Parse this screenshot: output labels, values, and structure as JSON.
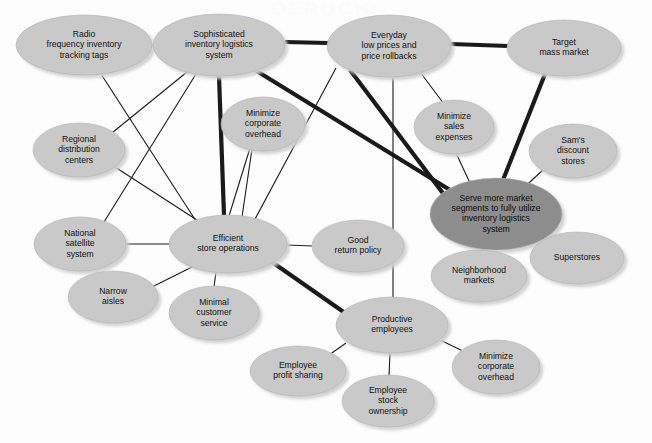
{
  "figure": {
    "kind": "activity-system-map",
    "watermark_text": "DERUCHI",
    "background_color": "#fdfdfd",
    "node_fill_light": "#c9c9c9",
    "node_fill_dark": "#8d8d8d",
    "node_stroke": "#b4b4b4",
    "node_shadow": "#dcdcdc",
    "edge_color": "#1a1a1a",
    "edge_thin_width": 1.1,
    "edge_thick_width": 4.2
  },
  "nodes": [
    {
      "id": "radio",
      "label_lines": [
        "Radio",
        "frequency inventory",
        "tracking tags"
      ],
      "cx": 84,
      "cy": 45,
      "rx": 68,
      "ry": 30,
      "tone": "light"
    },
    {
      "id": "sophisticated",
      "label_lines": [
        "Sophisticated",
        "inventory logistics",
        "system"
      ],
      "cx": 219,
      "cy": 45,
      "rx": 66,
      "ry": 31,
      "tone": "light"
    },
    {
      "id": "everyday",
      "label_lines": [
        "Everyday",
        "low prices and",
        "price rollbacks"
      ],
      "cx": 389,
      "cy": 46,
      "rx": 62,
      "ry": 31,
      "tone": "light"
    },
    {
      "id": "target",
      "label_lines": [
        "Target",
        "mass market"
      ],
      "cx": 564,
      "cy": 48,
      "rx": 57,
      "ry": 28,
      "tone": "light"
    },
    {
      "id": "minimize_corp_top",
      "label_lines": [
        "Minimize",
        "corporate",
        "overhead"
      ],
      "cx": 263,
      "cy": 124,
      "rx": 42,
      "ry": 27,
      "tone": "light"
    },
    {
      "id": "minimize_sales",
      "label_lines": [
        "Minimize",
        "sales",
        "expenses"
      ],
      "cx": 454,
      "cy": 127,
      "rx": 40,
      "ry": 27,
      "tone": "light"
    },
    {
      "id": "sams",
      "label_lines": [
        "Sam's",
        "discount",
        "stores"
      ],
      "cx": 573,
      "cy": 151,
      "rx": 44,
      "ry": 27,
      "tone": "light"
    },
    {
      "id": "regional",
      "label_lines": [
        "Regional",
        "distribution",
        "centers"
      ],
      "cx": 79,
      "cy": 150,
      "rx": 46,
      "ry": 27,
      "tone": "light"
    },
    {
      "id": "serve_more",
      "label_lines": [
        "Serve more market",
        "segments to fully utilize",
        "inventory logistics",
        "system"
      ],
      "cx": 496,
      "cy": 214,
      "rx": 66,
      "ry": 36,
      "tone": "dark"
    },
    {
      "id": "national_sat",
      "label_lines": [
        "National",
        "satellite",
        "system"
      ],
      "cx": 80,
      "cy": 244,
      "rx": 46,
      "ry": 27,
      "tone": "light"
    },
    {
      "id": "efficient",
      "label_lines": [
        "Efficient",
        "store operations"
      ],
      "cx": 228,
      "cy": 244,
      "rx": 59,
      "ry": 29,
      "tone": "light"
    },
    {
      "id": "good_return",
      "label_lines": [
        "Good",
        "return policy"
      ],
      "cx": 358,
      "cy": 246,
      "rx": 46,
      "ry": 26,
      "tone": "light"
    },
    {
      "id": "superstores",
      "label_lines": [
        "Superstores"
      ],
      "cx": 577,
      "cy": 258,
      "rx": 47,
      "ry": 26,
      "tone": "light"
    },
    {
      "id": "neighborhood",
      "label_lines": [
        "Neighborhood",
        "markets"
      ],
      "cx": 479,
      "cy": 276,
      "rx": 48,
      "ry": 26,
      "tone": "light"
    },
    {
      "id": "narrow",
      "label_lines": [
        "Narrow",
        "aisles"
      ],
      "cx": 113,
      "cy": 297,
      "rx": 45,
      "ry": 26,
      "tone": "light"
    },
    {
      "id": "minimal_cust",
      "label_lines": [
        "Minimal",
        "customer",
        "service"
      ],
      "cx": 214,
      "cy": 313,
      "rx": 45,
      "ry": 27,
      "tone": "light"
    },
    {
      "id": "productive",
      "label_lines": [
        "Productive",
        "employees"
      ],
      "cx": 392,
      "cy": 325,
      "rx": 56,
      "ry": 28,
      "tone": "light"
    },
    {
      "id": "emp_profit",
      "label_lines": [
        "Employee",
        "profit sharing"
      ],
      "cx": 298,
      "cy": 371,
      "rx": 48,
      "ry": 25,
      "tone": "light"
    },
    {
      "id": "minimize_corp_bottom",
      "label_lines": [
        "Minimize",
        "corporate",
        "overhead"
      ],
      "cx": 496,
      "cy": 367,
      "rx": 44,
      "ry": 27,
      "tone": "light"
    },
    {
      "id": "emp_stock",
      "label_lines": [
        "Employee",
        "stock",
        "ownership"
      ],
      "cx": 388,
      "cy": 401,
      "rx": 46,
      "ry": 26,
      "tone": "light"
    }
  ],
  "edges": [
    {
      "from": "radio",
      "to": "sophisticated",
      "weight": "thin",
      "x1": 152,
      "y1": 45,
      "x2": 154,
      "y2": 45
    },
    {
      "from": "sophisticated",
      "to": "everyday",
      "weight": "thick",
      "x1": 285,
      "y1": 42,
      "x2": 328,
      "y2": 43
    },
    {
      "from": "everyday",
      "to": "target",
      "weight": "thick",
      "x1": 451,
      "y1": 44,
      "x2": 508,
      "y2": 46
    },
    {
      "from": "sophisticated",
      "to": "efficient",
      "weight": "thick",
      "x1": 219,
      "y1": 76,
      "x2": 224,
      "y2": 215
    },
    {
      "from": "sophisticated",
      "to": "serve_more",
      "weight": "thick",
      "x1": 255,
      "y1": 70,
      "x2": 450,
      "y2": 190
    },
    {
      "from": "everyday",
      "to": "serve_more",
      "weight": "thick",
      "x1": 350,
      "y1": 70,
      "x2": 445,
      "y2": 196
    },
    {
      "from": "target",
      "to": "serve_more",
      "weight": "thick",
      "x1": 545,
      "y1": 74,
      "x2": 503,
      "y2": 180
    },
    {
      "from": "efficient",
      "to": "productive",
      "weight": "thick",
      "x1": 272,
      "y1": 262,
      "x2": 345,
      "y2": 313
    },
    {
      "from": "radio",
      "to": "efficient",
      "weight": "thin",
      "x1": 101,
      "y1": 74,
      "x2": 196,
      "y2": 221
    },
    {
      "from": "sophisticated",
      "to": "regional",
      "weight": "thin",
      "x1": 187,
      "y1": 72,
      "x2": 107,
      "y2": 137
    },
    {
      "from": "sophisticated",
      "to": "national_sat",
      "weight": "thin",
      "x1": 196,
      "y1": 74,
      "x2": 104,
      "y2": 222
    },
    {
      "from": "regional",
      "to": "efficient",
      "weight": "thin",
      "x1": 115,
      "y1": 167,
      "x2": 200,
      "y2": 222
    },
    {
      "from": "everyday",
      "to": "efficient",
      "weight": "thin",
      "x1": 336,
      "y1": 68,
      "x2": 254,
      "y2": 221
    },
    {
      "from": "everyday",
      "to": "minimize_sales",
      "weight": "thin",
      "x1": 420,
      "y1": 72,
      "x2": 444,
      "y2": 104
    },
    {
      "from": "everyday",
      "to": "productive",
      "weight": "thin",
      "x1": 393,
      "y1": 77,
      "x2": 393,
      "y2": 298
    },
    {
      "from": "minimize_corp_top",
      "to": "efficient",
      "weight": "thin",
      "x1": 250,
      "y1": 148,
      "x2": 229,
      "y2": 216
    },
    {
      "from": "minimize_corp_top",
      "to": "efficient_r",
      "weight": "thin",
      "x1": 252,
      "y1": 149,
      "x2": 242,
      "y2": 217
    },
    {
      "from": "minimize_sales",
      "to": "serve_more",
      "weight": "thin",
      "x1": 456,
      "y1": 153,
      "x2": 470,
      "y2": 183
    },
    {
      "from": "sams",
      "to": "serve_more",
      "weight": "thin",
      "x1": 543,
      "y1": 170,
      "x2": 519,
      "y2": 192
    },
    {
      "from": "serve_more",
      "to": "superstores",
      "weight": "thin",
      "x1": 532,
      "y1": 232,
      "x2": 556,
      "y2": 245
    },
    {
      "from": "serve_more",
      "to": "neighborhood",
      "weight": "thin",
      "x1": 484,
      "y1": 250,
      "x2": 480,
      "y2": 251
    },
    {
      "from": "national_sat",
      "to": "efficient",
      "weight": "thin",
      "x1": 126,
      "y1": 244,
      "x2": 169,
      "y2": 244
    },
    {
      "from": "efficient",
      "to": "good_return",
      "weight": "thin",
      "x1": 287,
      "y1": 245,
      "x2": 312,
      "y2": 246
    },
    {
      "from": "efficient",
      "to": "narrow",
      "weight": "thin",
      "x1": 196,
      "y1": 265,
      "x2": 150,
      "y2": 288
    },
    {
      "from": "efficient",
      "to": "minimal_cust",
      "weight": "thin",
      "x1": 216,
      "y1": 272,
      "x2": 214,
      "y2": 287
    },
    {
      "from": "productive",
      "to": "emp_profit",
      "weight": "thin",
      "x1": 346,
      "y1": 343,
      "x2": 329,
      "y2": 355
    },
    {
      "from": "productive",
      "to": "emp_stock",
      "weight": "thin",
      "x1": 390,
      "y1": 353,
      "x2": 389,
      "y2": 376
    },
    {
      "from": "productive",
      "to": "minimize_corp_bottom",
      "weight": "thin",
      "x1": 440,
      "y1": 340,
      "x2": 465,
      "y2": 352
    }
  ],
  "concepts": {
    "core_themes": [
      "Everyday low prices and price rollbacks",
      "Sophisticated inventory logistics system",
      "Target mass market",
      "Serve more market segments to fully utilize inventory logistics system",
      "Efficient store operations",
      "Productive employees"
    ],
    "highlighted_node": "Serve more market segments to fully utilize inventory logistics system"
  }
}
